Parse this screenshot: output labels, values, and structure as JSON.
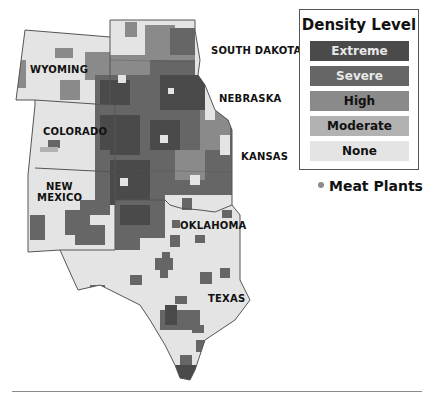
{
  "legend": {
    "title": "Density Level",
    "levels": [
      {
        "label": "Extreme",
        "color": "#4a4a4a",
        "text_color": "#e8e8e8"
      },
      {
        "label": "Severe",
        "color": "#666666",
        "text_color": "#e8e8e8"
      },
      {
        "label": "High",
        "color": "#8a8a8a",
        "text_color": "#111111"
      },
      {
        "label": "Moderate",
        "color": "#b2b2b2",
        "text_color": "#111111"
      },
      {
        "label": "None",
        "color": "#e4e4e4",
        "text_color": "#111111"
      }
    ],
    "meat_plants_label": "Meat Plants",
    "meat_plants_color": "#8a8a8a"
  },
  "states": [
    {
      "name": "WYOMING",
      "x": 30,
      "y": 64
    },
    {
      "name": "SOUTH DAKOTA",
      "x": 211,
      "y": 45
    },
    {
      "name": "NEBRASKA",
      "x": 219,
      "y": 93
    },
    {
      "name": "COLORADO",
      "x": 43,
      "y": 126
    },
    {
      "name": "KANSAS",
      "x": 241,
      "y": 151
    },
    {
      "name": "NEW",
      "x": 46,
      "y": 181
    },
    {
      "name": "MEXICO",
      "x": 37,
      "y": 192
    },
    {
      "name": "OKLAHOMA",
      "x": 180,
      "y": 220
    },
    {
      "name": "TEXAS",
      "x": 208,
      "y": 293
    }
  ],
  "colors": {
    "none": "#e4e4e4",
    "moderate": "#b2b2b2",
    "high": "#8a8a8a",
    "severe": "#666666",
    "extreme": "#4a4a4a",
    "border": "#555555"
  }
}
